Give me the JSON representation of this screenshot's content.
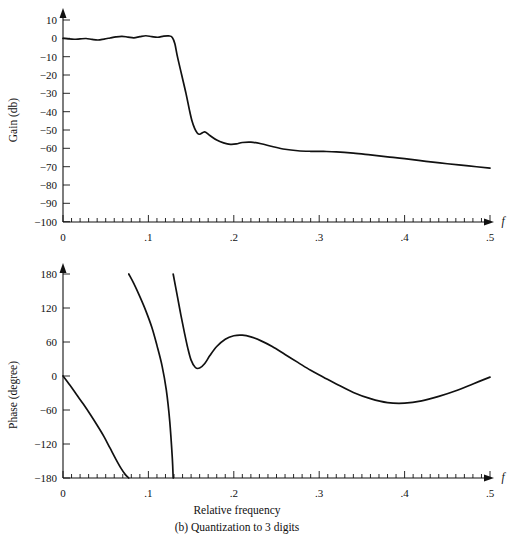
{
  "figure": {
    "caption": "(b) Quantization to 3 digits",
    "xlabel_shared": "Relative frequency"
  },
  "panels": {
    "gain": {
      "ylabel": "Gain (db)",
      "xaxis_symbol": "f",
      "ytick_labels": [
        "10",
        "0",
        "−10",
        "−20",
        "−30",
        "−40",
        "−50",
        "−60",
        "−70",
        "−80",
        "−90",
        "−100"
      ],
      "xtick_labels": [
        "0",
        ".1",
        ".2",
        ".3",
        ".4",
        ".5"
      ]
    },
    "phase": {
      "ylabel": "Phase (degree)",
      "xaxis_symbol": "f",
      "ytick_labels": [
        "180",
        "120",
        "60",
        "0",
        "−60",
        "−120",
        "−180"
      ],
      "xtick_labels": [
        "0",
        ".1",
        ".2",
        ".3",
        ".4",
        ".5"
      ]
    }
  },
  "colors": {
    "curve": "#111111",
    "axis": "#111111",
    "background": "#ffffff"
  },
  "chart_data": [
    {
      "type": "line",
      "id": "gain-response",
      "title": "",
      "xlabel": "f",
      "ylabel": "Gain (db)",
      "xlim": [
        0,
        0.5
      ],
      "ylim": [
        -100,
        10
      ],
      "xticks": [
        0,
        0.1,
        0.2,
        0.3,
        0.4,
        0.5
      ],
      "yticks": [
        10,
        0,
        -10,
        -20,
        -30,
        -40,
        -50,
        -60,
        -70,
        -80,
        -90,
        -100
      ],
      "minor_tick_step": 0.01,
      "grid": false,
      "legend": "none",
      "series": [
        {
          "name": "Gain",
          "x": [
            0.0,
            0.006,
            0.013,
            0.02,
            0.027,
            0.034,
            0.041,
            0.048,
            0.055,
            0.062,
            0.069,
            0.076,
            0.083,
            0.09,
            0.097,
            0.104,
            0.111,
            0.118,
            0.124,
            0.128,
            0.131,
            0.134,
            0.139,
            0.144,
            0.148,
            0.151,
            0.154,
            0.157,
            0.16,
            0.166,
            0.172,
            0.18,
            0.188,
            0.196,
            0.203,
            0.21,
            0.22,
            0.232,
            0.245,
            0.26,
            0.275,
            0.29,
            0.305,
            0.32,
            0.34,
            0.36,
            0.38,
            0.4,
            0.425,
            0.45,
            0.475,
            0.5
          ],
          "y": [
            0.0,
            -0.3,
            -0.5,
            -0.3,
            -0.1,
            -0.6,
            -0.9,
            -0.4,
            0.2,
            0.8,
            1.1,
            0.7,
            0.3,
            0.9,
            1.4,
            0.9,
            0.6,
            1.2,
            1.3,
            0.5,
            -3.0,
            -10.0,
            -20.0,
            -30.0,
            -39.0,
            -45.0,
            -49.0,
            -51.5,
            -52.3,
            -51.0,
            -53.0,
            -55.5,
            -57.0,
            -57.8,
            -57.6,
            -56.8,
            -56.6,
            -57.5,
            -59.0,
            -60.5,
            -61.3,
            -61.6,
            -61.7,
            -61.9,
            -62.6,
            -63.6,
            -64.6,
            -65.6,
            -67.1,
            -68.4,
            -69.6,
            -70.8
          ]
        }
      ]
    },
    {
      "type": "line",
      "id": "phase-response",
      "title": "",
      "xlabel": "f",
      "ylabel": "Phase (degree)",
      "xlim": [
        0,
        0.5
      ],
      "ylim": [
        -180,
        180
      ],
      "xticks": [
        0,
        0.1,
        0.2,
        0.3,
        0.4,
        0.5
      ],
      "yticks": [
        180,
        120,
        60,
        0,
        -60,
        -120,
        -180
      ],
      "minor_tick_step": 0.01,
      "grid": false,
      "legend": "none",
      "series": [
        {
          "name": "Phase branch 1",
          "x": [
            0.0,
            0.008,
            0.016,
            0.024,
            0.032,
            0.04,
            0.048,
            0.055,
            0.062,
            0.068,
            0.073,
            0.077
          ],
          "y": [
            0,
            -16,
            -33,
            -50,
            -68,
            -87,
            -107,
            -127,
            -147,
            -163,
            -174,
            -180
          ]
        },
        {
          "name": "Phase branch 2",
          "x": [
            0.077,
            0.083,
            0.09,
            0.097,
            0.104,
            0.11,
            0.116,
            0.121,
            0.125,
            0.128,
            0.129
          ],
          "y": [
            180,
            163,
            140,
            115,
            86,
            54,
            18,
            -25,
            -80,
            -145,
            -180
          ]
        },
        {
          "name": "Phase branch 3",
          "x": [
            0.129,
            0.134,
            0.138,
            0.142,
            0.146,
            0.15,
            0.155,
            0.16,
            0.166,
            0.172,
            0.18,
            0.19,
            0.2,
            0.21,
            0.22,
            0.232,
            0.245,
            0.26,
            0.275,
            0.29,
            0.305,
            0.32,
            0.34,
            0.36,
            0.38,
            0.4,
            0.42,
            0.44,
            0.46,
            0.48,
            0.5
          ],
          "y": [
            180,
            140,
            108,
            78,
            50,
            28,
            15,
            14,
            22,
            36,
            52,
            65,
            71,
            72,
            69,
            62,
            52,
            38,
            24,
            10,
            -2,
            -14,
            -29,
            -40,
            -47,
            -48,
            -44,
            -36,
            -26,
            -14,
            -2
          ]
        }
      ]
    }
  ]
}
